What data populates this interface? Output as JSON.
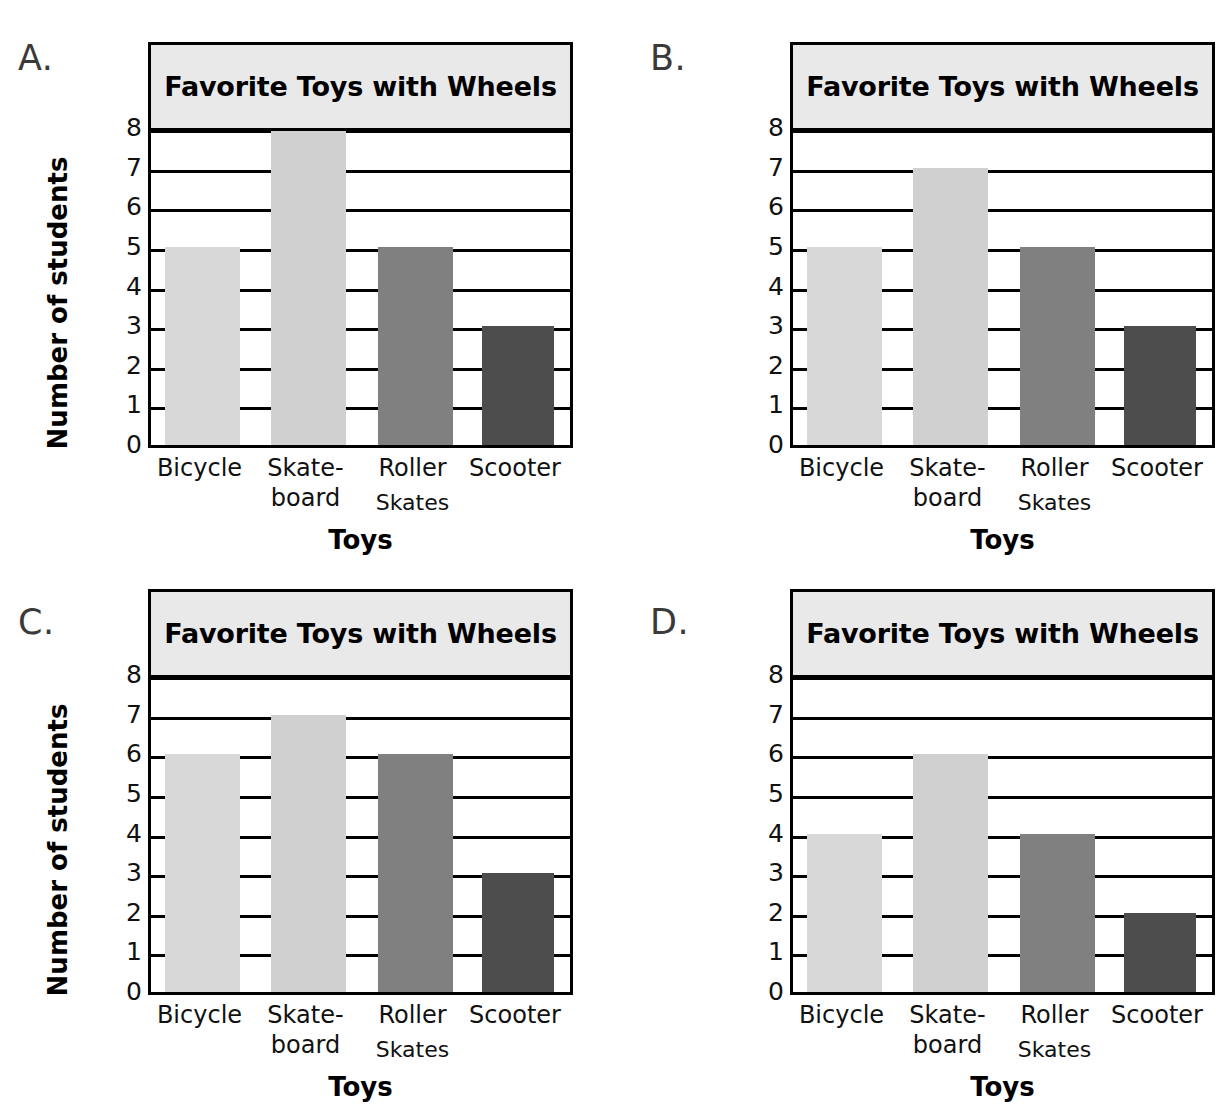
{
  "page": {
    "background": "#ffffff",
    "layout": "2x2 grid of four multiple-choice bar graphs"
  },
  "colors": {
    "bar_bicycle": "#d8d8d8",
    "bar_skateboard": "#d0d0d0",
    "bar_rollerskates": "#808080",
    "bar_scooter": "#4d4d4d",
    "title_band": "#e9e9e9",
    "axis": "#000000",
    "letter": "#3a3a3a"
  },
  "common": {
    "title": "Favorite Toys with Wheels",
    "ylabel": "Number of students",
    "xlabel": "Toys",
    "yticks": [
      "8",
      "7",
      "6",
      "5",
      "4",
      "3",
      "2",
      "1",
      "0"
    ],
    "categories": [
      {
        "line1": "Bicycle",
        "line2": ""
      },
      {
        "line1": "Skate-",
        "line2": "board"
      },
      {
        "line1": "Roller",
        "line2": "Skates"
      },
      {
        "line1": "Scooter",
        "line2": ""
      }
    ]
  },
  "panels": [
    {
      "letter": "A.",
      "values": [
        5,
        8,
        5,
        3
      ]
    },
    {
      "letter": "B.",
      "values": [
        5,
        7,
        5,
        3
      ]
    },
    {
      "letter": "C.",
      "values": [
        6,
        7,
        6,
        3
      ]
    },
    {
      "letter": "D.",
      "values": [
        4,
        6,
        4,
        2
      ]
    }
  ],
  "chart_data": [
    {
      "type": "bar",
      "label": "A",
      "title": "Favorite Toys with Wheels",
      "xlabel": "Toys",
      "ylabel": "Number of students",
      "categories": [
        "Bicycle",
        "Skate-board",
        "Roller Skates",
        "Scooter"
      ],
      "values": [
        5,
        8,
        5,
        3
      ],
      "ylim": [
        0,
        8
      ],
      "ytick_step": 1,
      "grid": true,
      "legend": "none"
    },
    {
      "type": "bar",
      "label": "B",
      "title": "Favorite Toys with Wheels",
      "xlabel": "Toys",
      "ylabel": "Number of students",
      "categories": [
        "Bicycle",
        "Skate-board",
        "Roller Skates",
        "Scooter"
      ],
      "values": [
        5,
        7,
        5,
        3
      ],
      "ylim": [
        0,
        8
      ],
      "ytick_step": 1,
      "grid": true,
      "legend": "none"
    },
    {
      "type": "bar",
      "label": "C",
      "title": "Favorite Toys with Wheels",
      "xlabel": "Toys",
      "ylabel": "Number of students",
      "categories": [
        "Bicycle",
        "Skate-board",
        "Roller Skates",
        "Scooter"
      ],
      "values": [
        6,
        7,
        6,
        3
      ],
      "ylim": [
        0,
        8
      ],
      "ytick_step": 1,
      "grid": true,
      "legend": "none"
    },
    {
      "type": "bar",
      "label": "D",
      "title": "Favorite Toys with Wheels",
      "xlabel": "Toys",
      "ylabel": "Number of students",
      "categories": [
        "Bicycle",
        "Skate-board",
        "Roller Skates",
        "Scooter"
      ],
      "values": [
        4,
        6,
        4,
        2
      ],
      "ylim": [
        0,
        8
      ],
      "ytick_step": 1,
      "grid": true,
      "legend": "none"
    }
  ]
}
